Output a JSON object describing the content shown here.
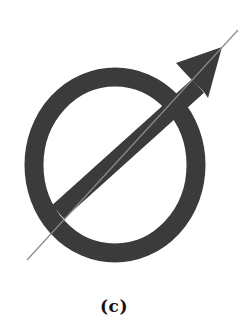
{
  "figure": {
    "caption": "(c)",
    "colors": {
      "shape_fill": "#3b3b3b",
      "guide_line": "#8a8a8a",
      "background": "#ffffff",
      "caption": "#111111"
    },
    "ring": {
      "cx": 115,
      "cy": 165,
      "rx": 81,
      "ry": 88,
      "stroke_width": 19
    },
    "shaft": {
      "x1": 58,
      "y1": 212,
      "x2": 196,
      "y2": 88,
      "width": 18
    },
    "arrowhead": {
      "tip": [
        222,
        47
      ],
      "left_barb": [
        176,
        63
      ],
      "right_barb": [
        208,
        98
      ],
      "notch": [
        196,
        84
      ]
    },
    "guide_line": {
      "x1": 27,
      "y1": 260,
      "x2": 238,
      "y2": 30
    }
  }
}
